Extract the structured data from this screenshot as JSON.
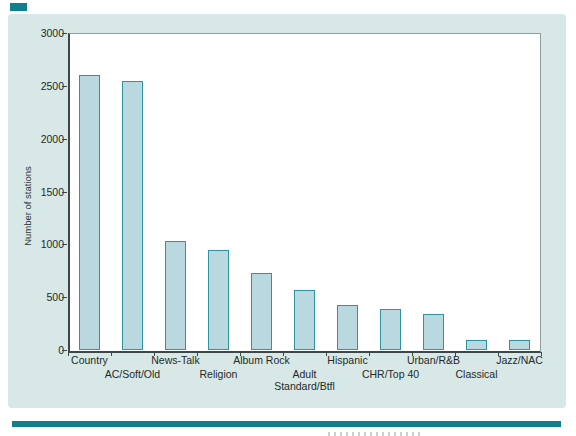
{
  "figure": {
    "panel_background": "#d8e8e6",
    "plot_background": "#ffffff",
    "accent_teal": "#11808e",
    "axis_color": "#3c4747",
    "frame_color": "#8f9e9e",
    "text_color": "#1f2a2a"
  },
  "chart_data": {
    "type": "bar",
    "title": "",
    "xlabel": "",
    "ylabel": "Number of stations",
    "ylim": [
      0,
      3000
    ],
    "yticks": [
      0,
      500,
      1000,
      1500,
      2000,
      2500,
      3000
    ],
    "grid": false,
    "legend": null,
    "categories": [
      "Country",
      "AC/Soft/Old",
      "News-Talk",
      "Religion",
      "Album Rock",
      "Adult Standard/Btfl",
      "Hispanic",
      "CHR/Top 40",
      "Urban/R&B",
      "Classical",
      "Jazz/NAC"
    ],
    "category_label_lines": [
      [
        "Country"
      ],
      [
        "AC/Soft/Old"
      ],
      [
        "News-Talk"
      ],
      [
        "Religion"
      ],
      [
        "Album Rock"
      ],
      [
        "Adult",
        "Standard/Btfl"
      ],
      [
        "Hispanic"
      ],
      [
        "CHR/Top 40"
      ],
      [
        "Urban/R&B"
      ],
      [
        "Classical"
      ],
      [
        "Jazz/NAC"
      ]
    ],
    "values": [
      2600,
      2550,
      1030,
      950,
      730,
      570,
      430,
      390,
      340,
      90,
      95
    ],
    "bar_fill": "#b9d8e0",
    "bar_border": "#2f93a0"
  }
}
